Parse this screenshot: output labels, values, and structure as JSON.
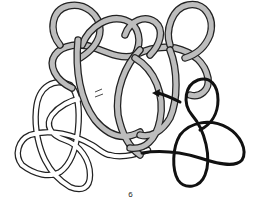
{
  "figure": {
    "step_label": "6",
    "colors": {
      "gray_cord": "#bdbdbd",
      "white_cord": "#ffffff",
      "black_cord": "#111111",
      "outline": "#222222",
      "background": "#ffffff"
    },
    "strands": [
      {
        "name": "gray-cord",
        "color": "gray"
      },
      {
        "name": "white-cord",
        "color": "white"
      },
      {
        "name": "black-cord",
        "color": "black"
      }
    ],
    "arrow": {
      "direction": "left",
      "color": "#111111"
    }
  }
}
